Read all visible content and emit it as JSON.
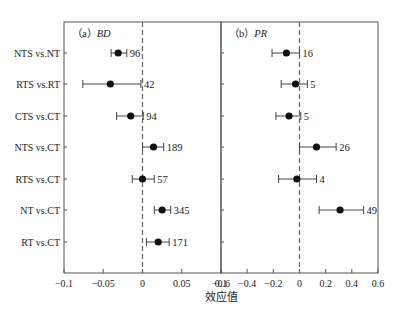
{
  "chart_data": {
    "type": "forest",
    "xlabel": "效应值",
    "categories": [
      "NTS vs.NT",
      "RTS vs.RT",
      "CTS vs.CT",
      "NTS vs.CT",
      "RTS vs.CT",
      "NT vs.CT",
      "RT vs.CT"
    ],
    "panels": [
      {
        "label_prefix": "（a）",
        "label_var": "BD",
        "xlim": [
          -0.1,
          0.1
        ],
        "ticks": [
          -0.1,
          -0.05,
          0,
          0.05,
          0.1
        ],
        "tick_labels": [
          "−0.1",
          "−0.05",
          "0",
          "0.05",
          "0.1"
        ],
        "reference_line": 0,
        "series": [
          {
            "category": "NTS vs.NT",
            "mean": -0.031,
            "lower": -0.04,
            "upper": -0.02,
            "n": "96"
          },
          {
            "category": "RTS vs.RT",
            "mean": -0.041,
            "lower": -0.076,
            "upper": -0.002,
            "n": "42"
          },
          {
            "category": "CTS vs.CT",
            "mean": -0.015,
            "lower": -0.033,
            "upper": 0.001,
            "n": "94"
          },
          {
            "category": "NTS vs.CT",
            "mean": 0.014,
            "lower": 0.0,
            "upper": 0.027,
            "n": "189"
          },
          {
            "category": "RTS vs.CT",
            "mean": 0.0,
            "lower": -0.013,
            "upper": 0.015,
            "n": "57"
          },
          {
            "category": "NT vs.CT",
            "mean": 0.025,
            "lower": 0.015,
            "upper": 0.036,
            "n": "345"
          },
          {
            "category": "RT vs.CT",
            "mean": 0.02,
            "lower": 0.005,
            "upper": 0.034,
            "n": "171"
          }
        ]
      },
      {
        "label_prefix": "（b）",
        "label_var": "PR",
        "xlim": [
          -0.6,
          0.6
        ],
        "ticks": [
          -0.6,
          -0.4,
          -0.2,
          0,
          0.2,
          0.4,
          0.6
        ],
        "tick_labels": [
          "−0.6",
          "−0.4",
          "−0.2",
          "0",
          "0.2",
          "0.4",
          "0.6"
        ],
        "reference_line": 0,
        "series": [
          {
            "category": "NTS vs.NT",
            "mean": -0.1,
            "lower": -0.21,
            "upper": 0.0,
            "n": "16"
          },
          {
            "category": "RTS vs.RT",
            "mean": -0.03,
            "lower": -0.14,
            "upper": 0.06,
            "n": "5"
          },
          {
            "category": "CTS vs.CT",
            "mean": -0.08,
            "lower": -0.18,
            "upper": 0.01,
            "n": "5"
          },
          {
            "category": "NTS vs.CT",
            "mean": 0.13,
            "lower": 0.0,
            "upper": 0.28,
            "n": "26"
          },
          {
            "category": "RTS vs.CT",
            "mean": -0.02,
            "lower": -0.16,
            "upper": 0.13,
            "n": "4"
          },
          {
            "category": "NT vs.CT",
            "mean": 0.31,
            "lower": 0.15,
            "upper": 0.49,
            "n": "49"
          }
        ]
      }
    ],
    "grid": false,
    "legend": "none"
  },
  "colors": {
    "axis": "#555555",
    "marker": "#111111",
    "errorbar": "#444444",
    "refline": "#666666",
    "text": "#222222"
  }
}
